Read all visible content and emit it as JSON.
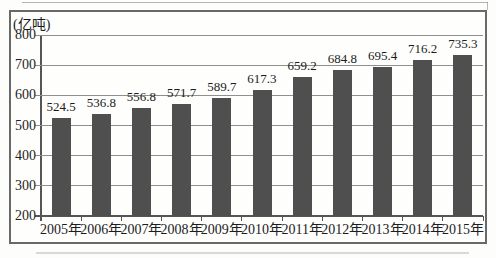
{
  "chart_data": {
    "type": "bar",
    "title": "",
    "ylabel": "(亿吨)",
    "xlabel": "",
    "categories": [
      "2005年",
      "2006年",
      "2007年",
      "2008年",
      "2009年",
      "2010年",
      "2011年",
      "2012年",
      "2013年",
      "2014年",
      "2015年"
    ],
    "values": [
      524.5,
      536.8,
      556.8,
      571.7,
      589.7,
      617.3,
      659.2,
      684.8,
      695.4,
      716.2,
      735.3
    ],
    "ylim": [
      200,
      800
    ],
    "yticks": [
      200,
      300,
      400,
      500,
      600,
      700,
      800
    ],
    "grid": "horizontal",
    "legend": "none",
    "value_labels_shown": true,
    "bar_color": "#4f4f4f"
  },
  "colors": {
    "bar": "#4f4f4f",
    "frame_border": "#696969",
    "gridline": "#8f8f8f",
    "axis": "#555555",
    "text": "#1c1c1c",
    "background": "#fdfdfc"
  }
}
